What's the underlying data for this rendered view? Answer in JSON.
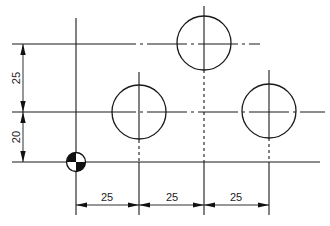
{
  "diagram": {
    "type": "technical-drawing",
    "datum_symbol": "origin-symbol",
    "horizontal_dimensions": [
      {
        "label": "25",
        "from": "datum",
        "to": "hole-1"
      },
      {
        "label": "25",
        "from": "hole-1",
        "to": "hole-2"
      },
      {
        "label": "25",
        "from": "hole-2",
        "to": "hole-3"
      }
    ],
    "vertical_dimensions": [
      {
        "label": "20",
        "from": "datum",
        "to": "row-1"
      },
      {
        "label": "25",
        "from": "row-1",
        "to": "row-2"
      }
    ],
    "holes": [
      {
        "id": "hole-1",
        "x": 25,
        "y": 20
      },
      {
        "id": "hole-2",
        "x": 50,
        "y": 45
      },
      {
        "id": "hole-3",
        "x": 75,
        "y": 20
      }
    ],
    "colors": {
      "line": "#1a1a1a",
      "background": "#ffffff"
    }
  }
}
